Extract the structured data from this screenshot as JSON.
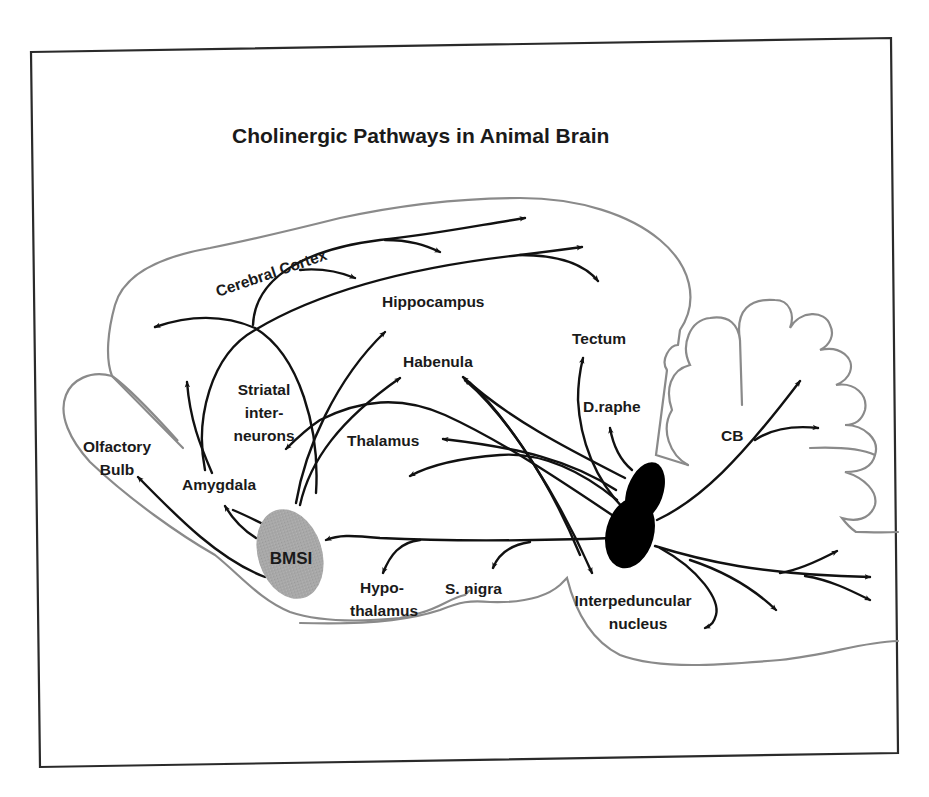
{
  "title": "Cholinergic Pathways in Animal Brain",
  "colors": {
    "frame": "#2a2a2a",
    "brain_outline": "#8a8a8a",
    "pathway": "#111111",
    "bmsi_fill": "#a6a6a6",
    "brainstem_nucleus_fill": "#000000",
    "background": "#ffffff"
  },
  "sources": {
    "bmsi": "BMSI",
    "brainstem": ""
  },
  "labels": {
    "cerebral_cortex": "Cerebral Cortex",
    "hippocampus": "Hippocampus",
    "tectum": "Tectum",
    "habenula": "Habenula",
    "striatal_line1": "Striatal",
    "striatal_line2": "inter-",
    "striatal_line3": "neurons",
    "d_raphe": "D.raphe",
    "cb": "CB",
    "thalamus": "Thalamus",
    "olfactory_line1": "Olfactory",
    "olfactory_line2": "Bulb",
    "amygdala": "Amygdala",
    "hypothalamus_line1": "Hypo-",
    "hypothalamus_line2": "thalamus",
    "s_nigra": "S. nigra",
    "interpeduncular_line1": "Interpeduncular",
    "interpeduncular_line2": "nucleus"
  },
  "pathways": [
    {
      "from": "BMSI",
      "to": "Olfactory Bulb"
    },
    {
      "from": "BMSI",
      "to": "Amygdala"
    },
    {
      "from": "BMSI",
      "to": "Cerebral Cortex"
    },
    {
      "from": "BMSI",
      "to": "Hippocampus"
    },
    {
      "from": "BMSI",
      "to": "Habenula"
    },
    {
      "from": "Brainstem",
      "to": "Striatal interneurons"
    },
    {
      "from": "Brainstem",
      "to": "BMSI"
    },
    {
      "from": "Brainstem",
      "to": "Hypothalamus"
    },
    {
      "from": "Brainstem",
      "to": "S. nigra"
    },
    {
      "from": "Brainstem",
      "to": "Thalamus"
    },
    {
      "from": "Brainstem",
      "to": "Habenula"
    },
    {
      "from": "Brainstem",
      "to": "Interpeduncular nucleus"
    },
    {
      "from": "Brainstem",
      "to": "Tectum"
    },
    {
      "from": "Brainstem",
      "to": "D.raphe"
    },
    {
      "from": "Brainstem",
      "to": "CB"
    },
    {
      "from": "Brainstem",
      "to": "Spinal cord / caudal"
    }
  ]
}
